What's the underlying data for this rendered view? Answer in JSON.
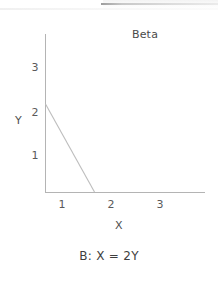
{
  "figure": {
    "title": "Beta",
    "caption": "B: X = 2Y",
    "axis_x_name": "X",
    "axis_y_name": "Y"
  },
  "ticks": {
    "y": [
      "3",
      "2",
      "1"
    ],
    "x": [
      "1",
      "2",
      "3"
    ]
  },
  "colors": {
    "axis": "#b4b4b4",
    "line": "#bdbdbd",
    "text": "#4a4a4a",
    "background": "#ffffff"
  },
  "chart_data": {
    "type": "line",
    "title": "Beta",
    "xlabel": "X",
    "ylabel": "Y",
    "xlim": [
      0,
      3.3
    ],
    "ylim": [
      0,
      3.55
    ],
    "xticks": [
      1,
      2,
      3
    ],
    "yticks": [
      1,
      2,
      3
    ],
    "grid": false,
    "legend": null,
    "annotations": [
      "B: X = 2Y"
    ],
    "series": [
      {
        "name": "B: X = 2Y",
        "x": [
          0,
          1
        ],
        "y": [
          2,
          0
        ]
      }
    ]
  }
}
